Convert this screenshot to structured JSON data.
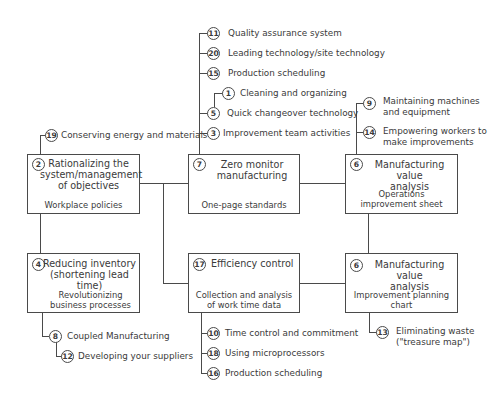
{
  "diagram": {
    "boxes": [
      {
        "num": "2",
        "title_lines": [
          "Rationalizing the",
          "system/management",
          "of objectives"
        ],
        "subtitle": "Workplace policies"
      },
      {
        "num": "7",
        "title_lines": [
          "Zero monitor",
          "manufacturing"
        ],
        "subtitle": "One-page standards"
      },
      {
        "num": "6",
        "title_lines": [
          "Manufacturing value",
          "analysis"
        ],
        "subtitle_lines": [
          "Operations",
          "improvement sheet"
        ]
      },
      {
        "num": "4",
        "title_lines": [
          "Reducing inventory",
          "(shortening lead time)"
        ],
        "subtitle_lines": [
          "Revolutionizing",
          "business processes"
        ]
      },
      {
        "num": "17",
        "title_lines": [
          "Efficiency control"
        ],
        "subtitle_lines": [
          "Collection and analysis",
          "of work time data"
        ]
      },
      {
        "num": "6",
        "title_lines": [
          "Manufacturing value",
          "analysis"
        ],
        "subtitle_lines": [
          "Improvement planning",
          "chart"
        ]
      }
    ],
    "branches": [
      {
        "num": "11",
        "label": "Quality assurance system"
      },
      {
        "num": "20",
        "label": "Leading technology/site technology"
      },
      {
        "num": "15",
        "label": "Production scheduling"
      },
      {
        "num": "1",
        "label": "Cleaning and organizing"
      },
      {
        "num": "5",
        "label": "Quick changeover technology"
      },
      {
        "num": "3",
        "label": "Improvement team activities"
      },
      {
        "num": "19",
        "label": "Conserving energy and materials"
      },
      {
        "num": "9",
        "label_lines": [
          "Maintaining machines",
          "and equipment"
        ]
      },
      {
        "num": "14",
        "label_lines": [
          "Empowering workers to",
          "make improvements"
        ]
      },
      {
        "num": "8",
        "label": "Coupled Manufacturing"
      },
      {
        "num": "12",
        "label": "Developing your suppliers"
      },
      {
        "num": "10",
        "label": "Time control and commitment"
      },
      {
        "num": "18",
        "label": "Using microprocessors"
      },
      {
        "num": "16",
        "label": "Production scheduling"
      },
      {
        "num": "13",
        "label_lines": [
          "Eliminating waste",
          "(\"treasure map\")"
        ]
      }
    ]
  }
}
